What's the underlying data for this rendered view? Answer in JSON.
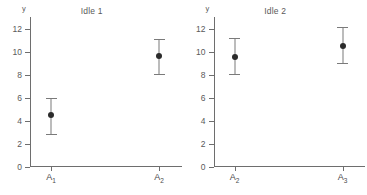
{
  "chart_data": [
    {
      "type": "scatter",
      "title": "Idle 1",
      "xlabel": "",
      "ylabel": "y",
      "ylim": [
        0,
        13
      ],
      "yticks": [
        0,
        2,
        4,
        6,
        8,
        10,
        12
      ],
      "grid": false,
      "legend": "none",
      "categories": [
        "A₁",
        "A₂"
      ],
      "category_labels": [
        {
          "base": "A",
          "sub": "1"
        },
        {
          "base": "A",
          "sub": "2"
        }
      ],
      "values": [
        4.5,
        9.6
      ],
      "error_low": [
        2.8,
        8.0
      ],
      "error_high": [
        6.0,
        11.1
      ]
    },
    {
      "type": "scatter",
      "title": "Idle 2",
      "xlabel": "",
      "ylabel": "y",
      "ylim": [
        0,
        13
      ],
      "yticks": [
        0,
        2,
        4,
        6,
        8,
        10,
        12
      ],
      "grid": false,
      "legend": "none",
      "categories": [
        "A₂",
        "A₃"
      ],
      "category_labels": [
        {
          "base": "A",
          "sub": "2"
        },
        {
          "base": "A",
          "sub": "3"
        }
      ],
      "values": [
        9.5,
        10.5
      ],
      "error_low": [
        8.0,
        8.9
      ],
      "error_high": [
        11.2,
        12.1
      ]
    }
  ],
  "style": {
    "axis_color": "#6e6e6e",
    "marker_color": "#2b2b2b",
    "errorbar_color": "#7a7a7a",
    "text_color": "#4a4a4a",
    "background": "#ffffff"
  }
}
